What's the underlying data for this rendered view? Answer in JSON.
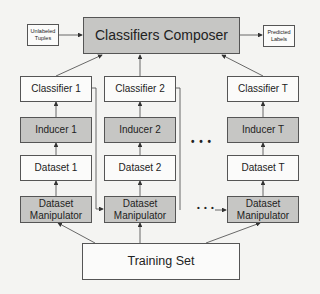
{
  "diagram": {
    "composer": {
      "label": "Classifiers Composer"
    },
    "input": {
      "label": "Unlabeled Tuples"
    },
    "output": {
      "label": "Predicted Labels"
    },
    "training_set": {
      "label": "Training Set"
    },
    "columns": [
      {
        "classifier": "Classifier 1",
        "inducer": "Inducer 1",
        "dataset": "Dataset 1",
        "manipulator": "Dataset Manipulator"
      },
      {
        "classifier": "Classifier 2",
        "inducer": "Inducer 2",
        "dataset": "Dataset 2",
        "manipulator": "Dataset Manipulator"
      },
      {
        "classifier": "Classifier T",
        "inducer": "Inducer T",
        "dataset": "Dataset T",
        "manipulator": "Dataset Manipulator"
      }
    ],
    "ellipsis": "• • •",
    "colors": {
      "gray_box": "#c6c6c4",
      "white_box": "#fbfbfa",
      "line": "#444444"
    }
  }
}
